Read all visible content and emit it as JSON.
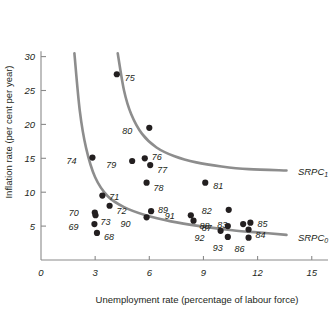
{
  "chart_data": {
    "type": "scatter",
    "title": "",
    "xlabel": "Unemployment rate (percentage of labour force)",
    "ylabel": "Inflation rate (per cent per year)",
    "xlim": [
      0,
      16
    ],
    "ylim": [
      0,
      31
    ],
    "xticks": [
      "0",
      "3",
      "6",
      "9",
      "12",
      "15"
    ],
    "xtick_values": [
      0,
      3,
      6,
      9,
      12,
      15
    ],
    "yticks": [
      "5",
      "10",
      "15",
      "20",
      "25",
      "30"
    ],
    "ytick_values": [
      5,
      10,
      15,
      20,
      25,
      30
    ],
    "grid": false,
    "legend": "none",
    "points": [
      {
        "label": "75",
        "x": 4.2,
        "y": 27.4,
        "lx": 8,
        "ly": 3.5
      },
      {
        "label": "80",
        "x": 6.0,
        "y": 19.5,
        "lx": -17,
        "ly": 3.5
      },
      {
        "label": "74",
        "x": 2.85,
        "y": 15.1,
        "lx": -16,
        "ly": 3.0
      },
      {
        "label": "76",
        "x": 5.75,
        "y": 15.0,
        "lx": 7,
        "ly": -1.0
      },
      {
        "label": "79",
        "x": 5.05,
        "y": 14.6,
        "lx": -16,
        "ly": 3.5
      },
      {
        "label": "77",
        "x": 6.05,
        "y": 14.0,
        "lx": 7,
        "ly": 5.0
      },
      {
        "label": "78",
        "x": 5.85,
        "y": 11.4,
        "lx": 7,
        "ly": 5.5
      },
      {
        "label": "81",
        "x": 9.1,
        "y": 11.4,
        "lx": 8,
        "ly": 3.5
      },
      {
        "label": "71",
        "x": 3.4,
        "y": 9.5,
        "lx": 7,
        "ly": 1.5
      },
      {
        "label": "72",
        "x": 3.8,
        "y": 8.0,
        "lx": 7,
        "ly": 5.0
      },
      {
        "label": "82",
        "x": 10.4,
        "y": 7.4,
        "lx": -17,
        "ly": 1.0
      },
      {
        "label": "89",
        "x": 6.1,
        "y": 7.2,
        "lx": 7,
        "ly": -1.5
      },
      {
        "label": "70",
        "x": 2.98,
        "y": 7.0,
        "lx": -16,
        "ly": 0.5
      },
      {
        "label": "73",
        "x": 3.02,
        "y": 6.6,
        "lx": 5,
        "ly": 6.5
      },
      {
        "label": "91",
        "x": 8.3,
        "y": 6.6,
        "lx": -16,
        "ly": 0.5
      },
      {
        "label": "90",
        "x": 5.85,
        "y": 6.3,
        "lx": -16,
        "ly": 7.0
      },
      {
        "label": "88",
        "x": 8.45,
        "y": 5.8,
        "lx": 6,
        "ly": 5.5
      },
      {
        "label": "85",
        "x": 11.6,
        "y": 5.5,
        "lx": 7,
        "ly": 1.5
      },
      {
        "label": "83",
        "x": 11.2,
        "y": 5.3,
        "lx": -16,
        "ly": 0.5
      },
      {
        "label": "69",
        "x": 2.96,
        "y": 5.3,
        "lx": -16,
        "ly": 2.5
      },
      {
        "label": "87",
        "x": 10.35,
        "y": 5.0,
        "lx": -16,
        "ly": 1.5
      },
      {
        "label": "84",
        "x": 11.5,
        "y": 4.5,
        "lx": 7,
        "ly": 5.5
      },
      {
        "label": "92",
        "x": 9.95,
        "y": 4.3,
        "lx": -16,
        "ly": 7.5
      },
      {
        "label": "68",
        "x": 3.1,
        "y": 4.0,
        "lx": 7,
        "ly": 4.0
      },
      {
        "label": "93",
        "x": 10.35,
        "y": 3.4,
        "lx": -5,
        "ly": 11.0
      },
      {
        "label": "86",
        "x": 11.5,
        "y": 3.3,
        "lx": -4,
        "ly": 11.5
      }
    ],
    "curves": [
      {
        "name": "SRPC0",
        "label": "SRPC",
        "sublabel": "0",
        "label_x": 13.9,
        "label_y": 3.4,
        "path": [
          {
            "x": 1.85,
            "y": 30.5
          },
          {
            "x": 2.15,
            "y": 22.0
          },
          {
            "x": 2.5,
            "y": 16.5
          },
          {
            "x": 3.0,
            "y": 12.2
          },
          {
            "x": 3.7,
            "y": 9.4
          },
          {
            "x": 4.6,
            "y": 7.8
          },
          {
            "x": 5.8,
            "y": 6.6
          },
          {
            "x": 7.2,
            "y": 5.7
          },
          {
            "x": 8.8,
            "y": 5.0
          },
          {
            "x": 10.6,
            "y": 4.4
          },
          {
            "x": 12.3,
            "y": 4.0
          },
          {
            "x": 13.6,
            "y": 3.7
          }
        ]
      },
      {
        "name": "SRPC1",
        "label": "SRPC",
        "sublabel": "1",
        "label_x": 13.9,
        "label_y": 13.2,
        "path": [
          {
            "x": 4.25,
            "y": 30.5
          },
          {
            "x": 4.6,
            "y": 25.0
          },
          {
            "x": 5.0,
            "y": 21.5
          },
          {
            "x": 5.6,
            "y": 18.6
          },
          {
            "x": 6.4,
            "y": 16.6
          },
          {
            "x": 7.4,
            "y": 15.3
          },
          {
            "x": 8.6,
            "y": 14.4
          },
          {
            "x": 10.0,
            "y": 13.8
          },
          {
            "x": 11.5,
            "y": 13.4
          },
          {
            "x": 13.6,
            "y": 13.2
          }
        ]
      }
    ]
  }
}
